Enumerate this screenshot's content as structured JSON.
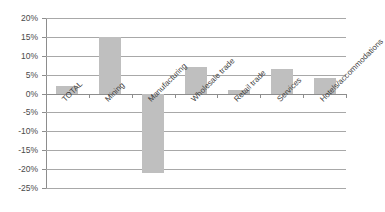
{
  "chart_data": {
    "type": "bar",
    "title": "",
    "xlabel": "",
    "ylabel": "",
    "categories": [
      "TOTAL",
      "Mining",
      "Manufacturing",
      "Wholesale trade",
      "Retail trade",
      "Services",
      "Hotels/accommodations"
    ],
    "values": [
      2,
      15,
      -21,
      7,
      1,
      6.5,
      4
    ],
    "ylim": [
      -25,
      20
    ],
    "ytick_labels": [
      "20%",
      "15%",
      "10%",
      "5%",
      "0%",
      "-5%",
      "-10%",
      "-15%",
      "-20%",
      "-25%"
    ],
    "ytick_values": [
      20,
      15,
      10,
      5,
      0,
      -5,
      -10,
      -15,
      -20,
      -25
    ],
    "grid": true,
    "legend": false,
    "legend_position": "none",
    "bar_color": "#bfbfbf",
    "gridline_color": "#a8a8a8",
    "axis_color": "#8d8d8d",
    "background_color": "#ffffff",
    "x_label_rotation": -45
  }
}
